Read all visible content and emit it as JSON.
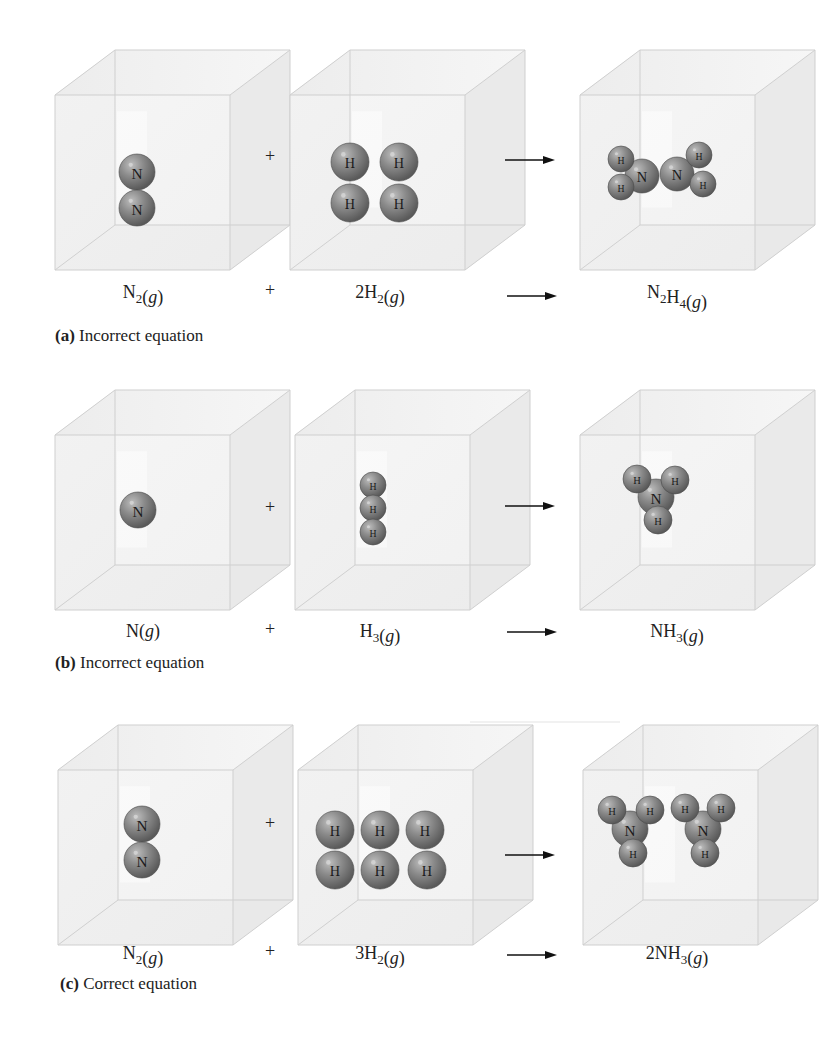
{
  "figure": {
    "rows": [
      {
        "id": "a",
        "caption_label": "(a)",
        "caption_text": " Incorrect equation",
        "y": 45,
        "plus_symbol": "+",
        "boxes": [
          {
            "x": 55,
            "atoms": [
              {
                "el": "N",
                "cx": 137,
                "cy": 172,
                "r": 18
              },
              {
                "el": "N",
                "cx": 137,
                "cy": 208,
                "r": 18
              }
            ]
          },
          {
            "x": 290,
            "atoms": [
              {
                "el": "H",
                "cx": 350,
                "cy": 162,
                "r": 19
              },
              {
                "el": "H",
                "cx": 399,
                "cy": 162,
                "r": 19
              },
              {
                "el": "H",
                "cx": 350,
                "cy": 203,
                "r": 19
              },
              {
                "el": "H",
                "cx": 399,
                "cy": 203,
                "r": 19
              }
            ]
          },
          {
            "x": 580,
            "atoms": [
              {
                "el": "N",
                "cx": 642,
                "cy": 176,
                "r": 17
              },
              {
                "el": "N",
                "cx": 677,
                "cy": 174,
                "r": 17
              },
              {
                "el": "H",
                "cx": 621,
                "cy": 159,
                "r": 13
              },
              {
                "el": "H",
                "cx": 621,
                "cy": 187,
                "r": 13
              },
              {
                "el": "H",
                "cx": 699,
                "cy": 155,
                "r": 13
              },
              {
                "el": "H",
                "cx": 703,
                "cy": 184,
                "r": 13
              }
            ]
          }
        ],
        "equation": [
          {
            "base": "N",
            "sub": "2",
            "tail": "(",
            "g": "g",
            ")": ")"
          },
          {
            "base": "2H",
            "sub": "2",
            "g": "g"
          },
          {
            "base": "N",
            "sub": "2",
            "base2": "H",
            "sub2": "4",
            "g": "g"
          }
        ],
        "eq_text": [
          "N₂(g)",
          "2H₂(g)",
          "N₂H₄(g)"
        ]
      },
      {
        "id": "b",
        "caption_label": "(b)",
        "caption_text": " Incorrect equation",
        "y": 385,
        "plus_symbol": "+",
        "boxes": [
          {
            "x": 55,
            "atoms": [
              {
                "el": "N",
                "cx": 138,
                "cy": 510,
                "r": 18
              }
            ]
          },
          {
            "x": 295,
            "atoms": [
              {
                "el": "H",
                "cx": 373,
                "cy": 485,
                "r": 13
              },
              {
                "el": "H",
                "cx": 373,
                "cy": 508,
                "r": 13
              },
              {
                "el": "H",
                "cx": 373,
                "cy": 532,
                "r": 13
              }
            ]
          },
          {
            "x": 580,
            "atoms": [
              {
                "el": "N",
                "cx": 656,
                "cy": 497,
                "r": 18
              },
              {
                "el": "H",
                "cx": 637,
                "cy": 479,
                "r": 14
              },
              {
                "el": "H",
                "cx": 675,
                "cy": 480,
                "r": 14
              },
              {
                "el": "H",
                "cx": 658,
                "cy": 520,
                "r": 14
              }
            ]
          }
        ],
        "eq_text": [
          "N(g)",
          "H₃(g)",
          "NH₃(g)"
        ]
      },
      {
        "id": "c",
        "caption_label": "(c)",
        "caption_text": " Correct equation",
        "y": 720,
        "plus_symbol": "+",
        "boxes": [
          {
            "x": 58,
            "atoms": [
              {
                "el": "N",
                "cx": 142,
                "cy": 824,
                "r": 18
              },
              {
                "el": "N",
                "cx": 142,
                "cy": 860,
                "r": 18
              }
            ]
          },
          {
            "x": 298,
            "atoms": [
              {
                "el": "H",
                "cx": 335,
                "cy": 830,
                "r": 19
              },
              {
                "el": "H",
                "cx": 380,
                "cy": 830,
                "r": 19
              },
              {
                "el": "H",
                "cx": 425,
                "cy": 830,
                "r": 19
              },
              {
                "el": "H",
                "cx": 335,
                "cy": 870,
                "r": 19
              },
              {
                "el": "H",
                "cx": 380,
                "cy": 870,
                "r": 19
              },
              {
                "el": "H",
                "cx": 427,
                "cy": 870,
                "r": 19
              }
            ]
          },
          {
            "x": 583,
            "atoms": [
              {
                "el": "N",
                "cx": 630,
                "cy": 829,
                "r": 18
              },
              {
                "el": "H",
                "cx": 612,
                "cy": 810,
                "r": 14
              },
              {
                "el": "H",
                "cx": 650,
                "cy": 810,
                "r": 14
              },
              {
                "el": "H",
                "cx": 633,
                "cy": 853,
                "r": 14
              },
              {
                "el": "N",
                "cx": 703,
                "cy": 829,
                "r": 18
              },
              {
                "el": "H",
                "cx": 685,
                "cy": 808,
                "r": 14
              },
              {
                "el": "H",
                "cx": 721,
                "cy": 808,
                "r": 14
              },
              {
                "el": "H",
                "cx": 705,
                "cy": 853,
                "r": 14
              }
            ]
          }
        ],
        "eq_text": [
          "N₂(g)",
          "3H₂(g)",
          "2NH₃(g)"
        ]
      }
    ],
    "colors": {
      "atom_fill": "#8a8a8a",
      "atom_dark": "#5e5e5e",
      "atom_light": "#b4b4b4",
      "cube_edge": "#cfcfcf",
      "cube_face": "#eeeeee",
      "arrow": "#111111"
    }
  },
  "equations": {
    "a": {
      "reactant1": {
        "base": "N",
        "sub": "2",
        "state": "g"
      },
      "plus": "+",
      "reactant2": {
        "coef": "2",
        "base": "H",
        "sub": "2",
        "state": "g"
      },
      "arrow": "⟶",
      "product": {
        "parts": [
          {
            "base": "N",
            "sub": "2"
          },
          {
            "base": "H",
            "sub": "4"
          }
        ],
        "state": "g"
      }
    },
    "b": {
      "reactant1": {
        "base": "N",
        "sub": "",
        "state": "g"
      },
      "plus": "+",
      "reactant2": {
        "coef": "",
        "base": "H",
        "sub": "3",
        "state": "g"
      },
      "arrow": "⟶",
      "product": {
        "parts": [
          {
            "base": "N",
            "sub": ""
          },
          {
            "base": "H",
            "sub": "3"
          }
        ],
        "state": "g"
      }
    },
    "c": {
      "reactant1": {
        "base": "N",
        "sub": "2",
        "state": "g"
      },
      "plus": "+",
      "reactant2": {
        "coef": "3",
        "base": "H",
        "sub": "2",
        "state": "g"
      },
      "arrow": "⟶",
      "product": {
        "coef": "2",
        "parts": [
          {
            "base": "N",
            "sub": ""
          },
          {
            "base": "H",
            "sub": "3"
          }
        ],
        "state": "g"
      }
    }
  },
  "captions": {
    "a": {
      "label": "(a)",
      "text": " Incorrect equation"
    },
    "b": {
      "label": "(b)",
      "text": " Incorrect equation"
    },
    "c": {
      "label": "(c)",
      "text": " Correct equation"
    }
  }
}
